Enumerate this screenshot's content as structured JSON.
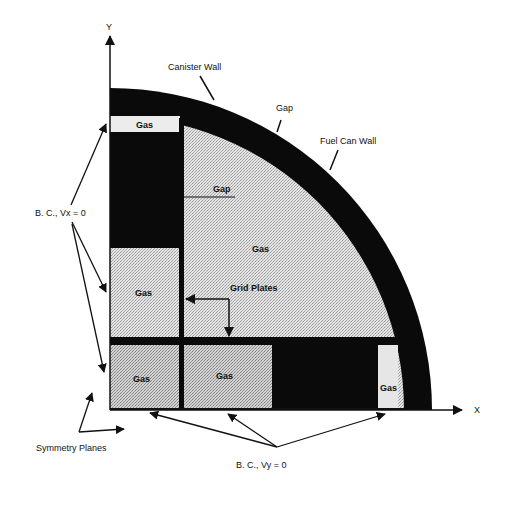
{
  "figure": {
    "type": "cross-section diagram"
  },
  "axes": {
    "x_label": "X",
    "y_label": "Y"
  },
  "labels": {
    "canister_wall": "Canister  Wall",
    "gap_outer": "Gap",
    "fuel_can_wall": "Fuel Can Wall",
    "gap_inner": "Gap",
    "gas_center": "Gas",
    "grid_plates": "Grid  Plates",
    "gas_top_strip": "Gas",
    "gas_left_middle": "Gas",
    "gas_bottom_left": "Gas",
    "gas_bottom_middle": "Gas",
    "gas_bottom_right": "Gas",
    "bc_vx": "B. C., Vx = 0",
    "bc_vy": "B. C., Vy = 0",
    "symmetry_planes": "Symmetry  Planes"
  },
  "colors": {
    "solid": "#0a0a0a",
    "gas_light": "#e4e4e4",
    "gas_medium": "#cfcfcf",
    "background": "#ffffff"
  }
}
